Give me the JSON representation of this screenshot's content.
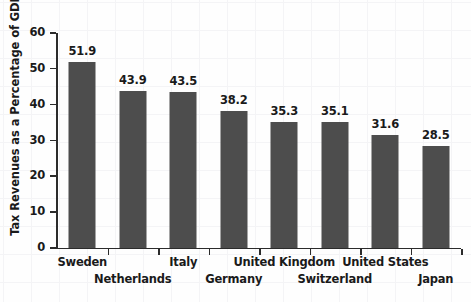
{
  "chart_data": {
    "type": "bar",
    "title": "",
    "xlabel": "",
    "ylabel": "Tax Revenues as a Percentage of GDP",
    "categories": [
      "Sweden",
      "Netherlands",
      "Italy",
      "Germany",
      "United Kingdom",
      "Switzerland",
      "United States",
      "Japan"
    ],
    "values": [
      51.9,
      43.9,
      43.5,
      38.2,
      35.3,
      35.1,
      31.6,
      28.5
    ],
    "value_labels": [
      "51.9",
      "43.9",
      "43.5",
      "38.2",
      "35.3",
      "35.1",
      "31.6",
      "28.5"
    ],
    "ylim": [
      0,
      60
    ],
    "yticks": [
      0,
      10,
      20,
      30,
      40,
      50,
      60
    ],
    "ytick_labels": [
      "0",
      "10",
      "20",
      "30",
      "40",
      "50",
      "60"
    ],
    "grid": false,
    "legend": "none",
    "bar_color": "#4d4d4d",
    "axis_color": "#2b2b2b",
    "text_color": "#1a1a1a",
    "background_color": "#fefefe",
    "label_rows": [
      "a",
      "b",
      "a",
      "b",
      "a",
      "b",
      "a",
      "b"
    ]
  }
}
